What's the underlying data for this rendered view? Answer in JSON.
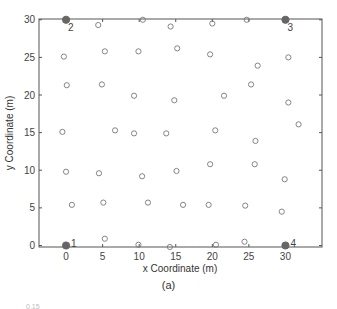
{
  "chart_data": {
    "type": "scatter",
    "title": "",
    "xlabel": "x Coordinate (m)",
    "ylabel": "y Coordinate (m)",
    "xlim": [
      -3.7,
      35
    ],
    "ylim": [
      -0.2,
      30.1
    ],
    "xticks": [
      0,
      5,
      10,
      15,
      20,
      25,
      30
    ],
    "yticks": [
      0,
      5,
      10,
      15,
      20,
      25,
      30
    ],
    "grid": false,
    "legend": null,
    "series": [
      {
        "name": "reference points",
        "marker": "filled-circle",
        "color": "#666666",
        "points": [
          {
            "x": 0,
            "y": 0,
            "label": "1"
          },
          {
            "x": 0,
            "y": 30,
            "label": "2"
          },
          {
            "x": 30,
            "y": 30,
            "label": "3"
          },
          {
            "x": 30,
            "y": 0,
            "label": "4"
          }
        ]
      },
      {
        "name": "measurement points",
        "marker": "open-circle",
        "color": "#777777",
        "points": [
          {
            "x": 4.4,
            "y": 29.3
          },
          {
            "x": 10.5,
            "y": 30.0
          },
          {
            "x": 14.3,
            "y": 29.1
          },
          {
            "x": 20.0,
            "y": 29.5
          },
          {
            "x": 24.7,
            "y": 30.0
          },
          {
            "x": -0.3,
            "y": 25.1
          },
          {
            "x": 5.3,
            "y": 25.8
          },
          {
            "x": 9.9,
            "y": 25.8
          },
          {
            "x": 15.2,
            "y": 26.2
          },
          {
            "x": 19.7,
            "y": 25.4
          },
          {
            "x": 30.4,
            "y": 25.0
          },
          {
            "x": 26.2,
            "y": 23.9
          },
          {
            "x": 0.1,
            "y": 21.3
          },
          {
            "x": 4.9,
            "y": 21.4
          },
          {
            "x": 25.3,
            "y": 21.4
          },
          {
            "x": 9.3,
            "y": 19.9
          },
          {
            "x": 14.8,
            "y": 19.3
          },
          {
            "x": 21.6,
            "y": 19.9
          },
          {
            "x": 30.4,
            "y": 19.0
          },
          {
            "x": 31.8,
            "y": 16.1
          },
          {
            "x": -0.5,
            "y": 15.1
          },
          {
            "x": 6.7,
            "y": 15.3
          },
          {
            "x": 9.3,
            "y": 14.9
          },
          {
            "x": 13.7,
            "y": 14.9
          },
          {
            "x": 20.4,
            "y": 15.3
          },
          {
            "x": 25.9,
            "y": 13.9
          },
          {
            "x": 19.7,
            "y": 10.8
          },
          {
            "x": 25.8,
            "y": 10.8
          },
          {
            "x": 0.0,
            "y": 9.8
          },
          {
            "x": 4.5,
            "y": 9.6
          },
          {
            "x": 10.4,
            "y": 9.2
          },
          {
            "x": 15.1,
            "y": 9.9
          },
          {
            "x": 29.9,
            "y": 8.8
          },
          {
            "x": 0.8,
            "y": 5.4
          },
          {
            "x": 5.1,
            "y": 5.7
          },
          {
            "x": 11.2,
            "y": 5.7
          },
          {
            "x": 16.0,
            "y": 5.4
          },
          {
            "x": 19.5,
            "y": 5.4
          },
          {
            "x": 24.5,
            "y": 5.3
          },
          {
            "x": 29.5,
            "y": 4.5
          },
          {
            "x": 5.3,
            "y": 0.9
          },
          {
            "x": 24.4,
            "y": 0.5
          },
          {
            "x": 9.9,
            "y": 0.1
          },
          {
            "x": 14.2,
            "y": -0.2
          },
          {
            "x": 20.5,
            "y": 0.1
          }
        ]
      }
    ]
  },
  "caption": "(a)",
  "stray_text": "0.15"
}
